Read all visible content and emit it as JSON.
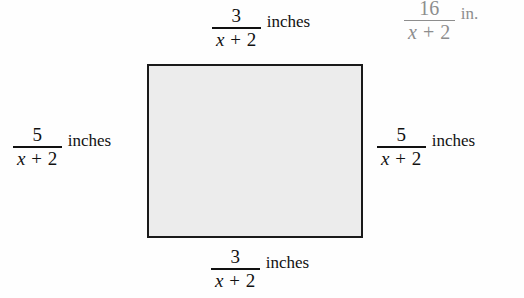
{
  "figure": {
    "type": "geometry-diagram",
    "shape": "rectangle",
    "fill_color": "#ececec",
    "stroke_color": "#1a1a1a",
    "background_color": "#ffffff",
    "overlay_text_color": "#8d8d8d"
  },
  "labels": {
    "top": {
      "numerator": "3",
      "denominator_var": "x",
      "denominator_rest": "+ 2",
      "unit": "inches"
    },
    "bottom": {
      "numerator": "3",
      "denominator_var": "x",
      "denominator_rest": "+ 2",
      "unit": "inches"
    },
    "left": {
      "numerator": "5",
      "denominator_var": "x",
      "denominator_rest": "+ 2",
      "unit": "inches"
    },
    "right": {
      "numerator": "5",
      "denominator_var": "x",
      "denominator_rest": "+ 2",
      "unit": "inches"
    },
    "overlay": {
      "numerator": "16",
      "denominator_var": "x",
      "denominator_rest": "+ 2",
      "unit": "in."
    }
  }
}
